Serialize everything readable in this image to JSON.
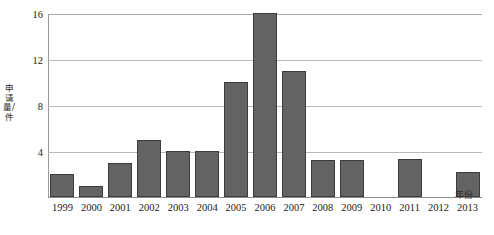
{
  "chart_data": {
    "type": "bar",
    "title": "",
    "xlabel": "年份",
    "ylabel": "申请量/件",
    "categories": [
      "1999",
      "2000",
      "2001",
      "2002",
      "2003",
      "2004",
      "2005",
      "2006",
      "2007",
      "2008",
      "2009",
      "2010",
      "2011",
      "2012",
      "2013"
    ],
    "values": [
      2,
      1,
      3,
      5,
      4,
      4,
      10,
      16,
      11,
      3.2,
      3.2,
      0,
      3.3,
      0,
      2.2
    ],
    "ylim": [
      0,
      16
    ],
    "yticks": [
      4,
      8,
      12,
      16
    ],
    "ytick_labels": [
      "4",
      "8",
      "12",
      "16"
    ],
    "grid": true,
    "legend": null,
    "bar_color": "#636363",
    "bar_edge_color": "#3d3d3d",
    "gridline_color": "#b9b9b9",
    "axis_color": "#8c8c8c"
  }
}
